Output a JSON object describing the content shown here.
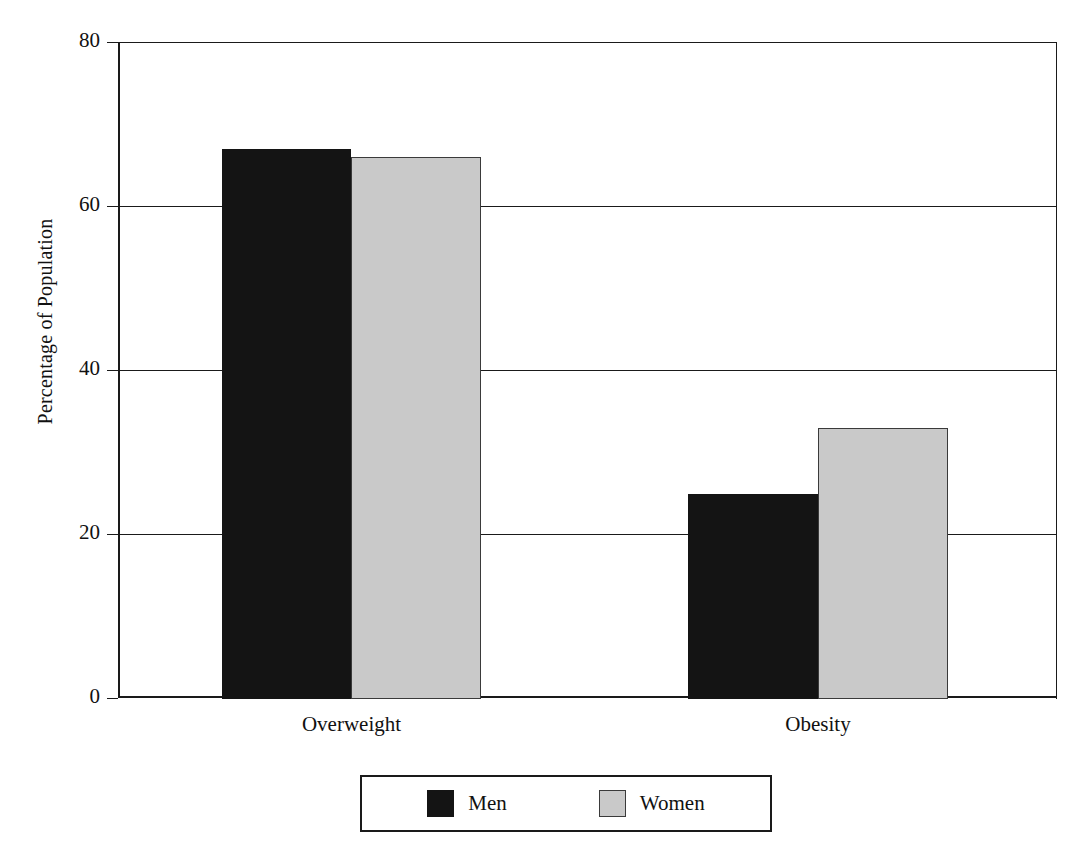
{
  "chart_data": {
    "type": "bar",
    "title": "",
    "subtitle": "",
    "xlabel": "",
    "ylabel": "Percentage of Population",
    "categories": [
      "Overweight",
      "Obesity"
    ],
    "series": [
      {
        "name": "Men",
        "values": [
          67,
          25
        ],
        "color": "#141414"
      },
      {
        "name": "Women",
        "values": [
          66,
          33
        ],
        "color": "#c9c9c9"
      }
    ],
    "ylim": [
      0,
      80
    ],
    "yticks": [
      0,
      20,
      40,
      60,
      80
    ],
    "ytick_labels": [
      "0",
      "20",
      "40",
      "60",
      "80"
    ],
    "grid": true,
    "grid_axis": "y",
    "legend_position": "bottom",
    "bar_grouping": "grouped",
    "orientation": "vertical"
  },
  "axes": {
    "y_title": "Percentage of Population",
    "ticks": [
      {
        "value": 80,
        "label": "80"
      },
      {
        "value": 60,
        "label": "60"
      },
      {
        "value": 40,
        "label": "40"
      },
      {
        "value": 20,
        "label": "20"
      },
      {
        "value": 0,
        "label": "0"
      }
    ]
  },
  "categories": [
    {
      "label": "Overweight"
    },
    {
      "label": "Obesity"
    }
  ],
  "legend": {
    "entries": [
      {
        "label": "Men",
        "color": "#141414"
      },
      {
        "label": "Women",
        "color": "#c9c9c9"
      }
    ]
  },
  "bars": [
    {
      "group": "Overweight",
      "series": "Men",
      "value": 67
    },
    {
      "group": "Overweight",
      "series": "Women",
      "value": 66
    },
    {
      "group": "Obesity",
      "series": "Men",
      "value": 25
    },
    {
      "group": "Obesity",
      "series": "Women",
      "value": 33
    }
  ]
}
